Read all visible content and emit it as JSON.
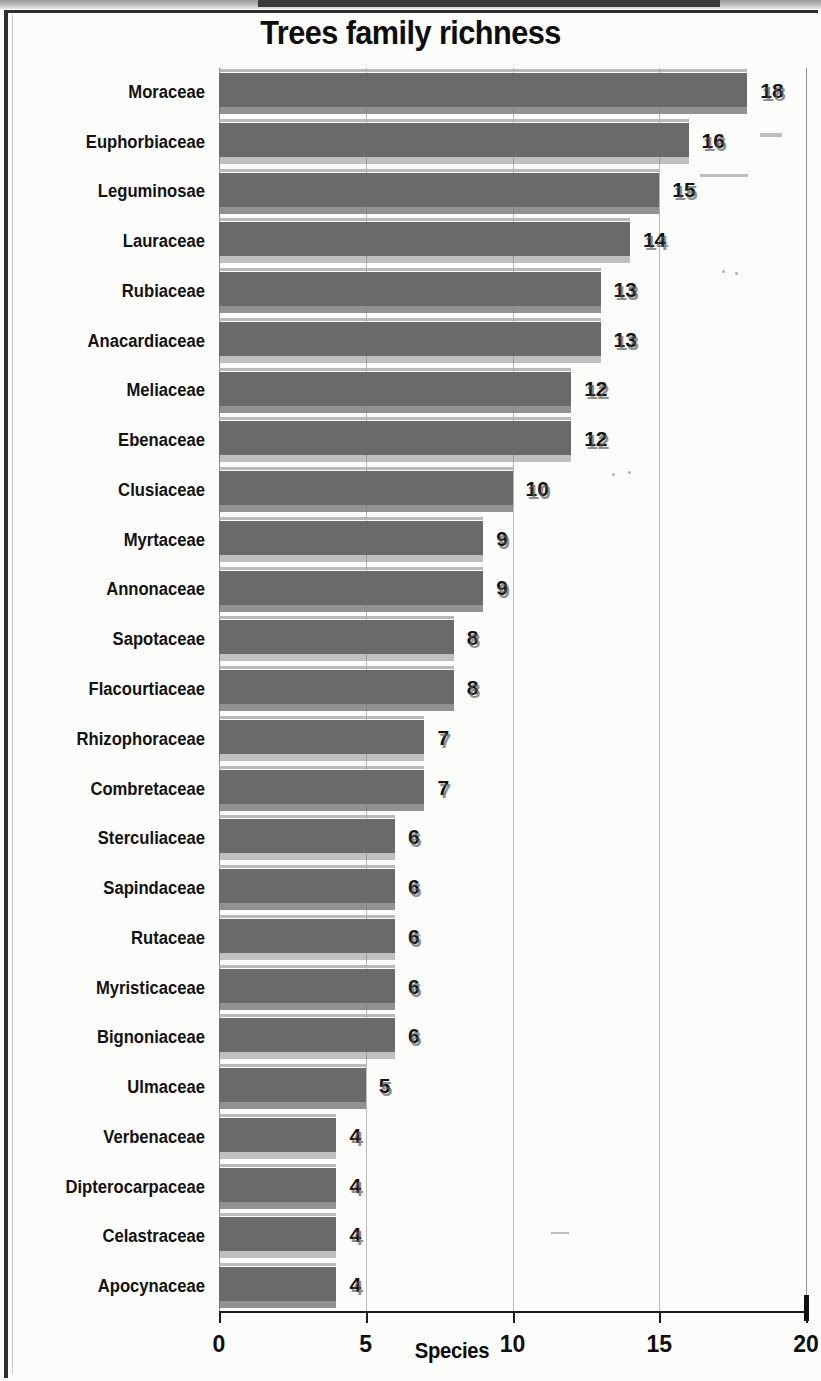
{
  "chart_data": {
    "type": "bar",
    "orientation": "horizontal",
    "title": "Trees family richness",
    "xlabel": "Species",
    "ylabel": "",
    "xlim": [
      0,
      20
    ],
    "xticks": [
      "0",
      "5",
      "10",
      "15",
      "20"
    ],
    "grid": true,
    "legend": null,
    "bar_color": "#6c6c6c",
    "categories": [
      "Moraceae",
      "Euphorbiaceae",
      "Leguminosae",
      "Lauraceae",
      "Rubiaceae",
      "Anacardiaceae",
      "Meliaceae",
      "Ebenaceae",
      "Clusiaceae",
      "Myrtaceae",
      "Annonaceae",
      "Sapotaceae",
      "Flacourtiaceae",
      "Rhizophoraceae",
      "Combretaceae",
      "Sterculiaceae",
      "Sapindaceae",
      "Rutaceae",
      "Myristicaceae",
      "Bignoniaceae",
      "Ulmaceae",
      "Verbenaceae",
      "Dipterocarpaceae",
      "Celastraceae",
      "Apocynaceae"
    ],
    "values": [
      18,
      16,
      15,
      14,
      13,
      13,
      12,
      12,
      10,
      9,
      9,
      8,
      8,
      7,
      7,
      6,
      6,
      6,
      6,
      6,
      5,
      4,
      4,
      4,
      4
    ],
    "value_labels": [
      "18",
      "16",
      "15",
      "14",
      "13",
      "13",
      "12",
      "12",
      "10",
      "9",
      "9",
      "8",
      "8",
      "7",
      "7",
      "6",
      "6",
      "6",
      "6",
      "6",
      "5",
      "4",
      "4",
      "4",
      "4"
    ]
  }
}
